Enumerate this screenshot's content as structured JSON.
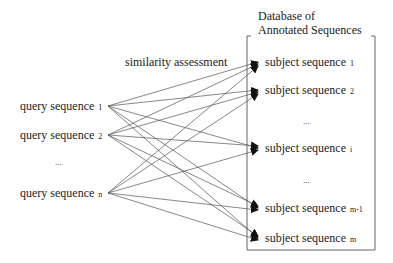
{
  "database": {
    "title_line1": "Database of",
    "title_line2": "Annotated Sequences"
  },
  "edge_label": "similarity assessment",
  "queries": [
    {
      "label": "query sequence",
      "index": "1"
    },
    {
      "label": "query sequence",
      "index": "2"
    },
    {
      "ellipsis": "..."
    },
    {
      "label": "query sequence",
      "index": "n"
    }
  ],
  "subjects": [
    {
      "label": "subject sequence",
      "index": "1"
    },
    {
      "label": "subject sequence",
      "index": "2"
    },
    {
      "ellipsis": "..."
    },
    {
      "label": "subject sequence",
      "index": "i"
    },
    {
      "ellipsis": "..."
    },
    {
      "label": "subject sequence",
      "index": "m-1"
    },
    {
      "label": "subject sequence",
      "index": "m"
    }
  ],
  "colors": {
    "line": "#555555",
    "text": "#222222",
    "box": "#666666"
  }
}
